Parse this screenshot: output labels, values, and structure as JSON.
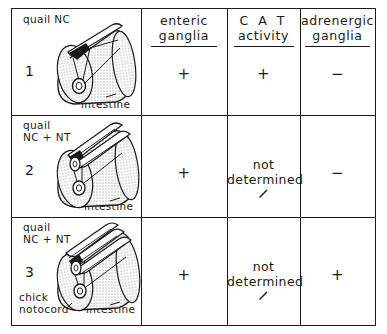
{
  "figure": {
    "type": "experimental-results-table",
    "columns": [
      {
        "id": "graft",
        "header_lines": []
      },
      {
        "id": "enteric",
        "header_lines": [
          "enteric",
          "ganglia"
        ]
      },
      {
        "id": "cat",
        "header_lines": [
          "C A T",
          "activity"
        ]
      },
      {
        "id": "adrenergic",
        "header_lines": [
          "adrenergic",
          "ganglia"
        ]
      }
    ],
    "rows": [
      {
        "number": "1",
        "graft_label": [
          "quail NC"
        ],
        "host_labels": [
          [
            "chick",
            "intestine"
          ]
        ],
        "enteric": "+",
        "cat": "+",
        "cat_note": null,
        "adrenergic": "−"
      },
      {
        "number": "2",
        "graft_label": [
          "quail",
          "NC + NT"
        ],
        "host_labels": [
          [
            "chick",
            "intestine"
          ]
        ],
        "enteric": "+",
        "cat": null,
        "cat_note": [
          "not",
          "determined"
        ],
        "adrenergic": "−"
      },
      {
        "number": "3",
        "graft_label": [
          "quail",
          "NC + NT"
        ],
        "host_labels": [
          [
            "chick",
            "notocord"
          ],
          [
            "chick",
            "intestine"
          ]
        ],
        "enteric": "+",
        "cat": null,
        "cat_note": [
          "not",
          "determined"
        ],
        "adrenergic": "+"
      }
    ]
  },
  "colors": {
    "ink": "#1a1a1a",
    "paper": "#ffffff",
    "stipple": "#6b6b6b",
    "crest_fill": "#1a1a1a"
  }
}
